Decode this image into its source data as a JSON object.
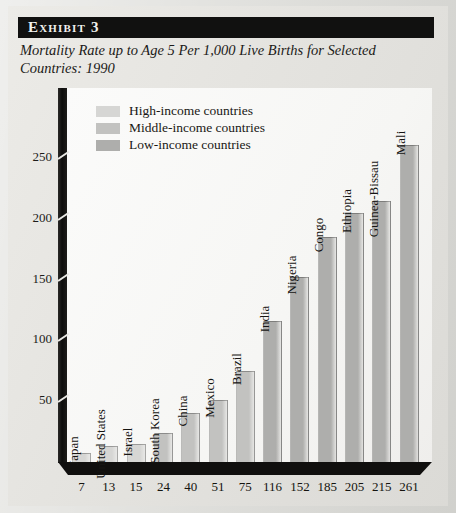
{
  "exhibit": {
    "label": "Exhibit 3",
    "title": "Mortality Rate up to Age 5 Per 1,000 Live Births for Selected Countries: 1990"
  },
  "legend": {
    "items": [
      {
        "label": "High-income countries",
        "color": "#d6d6d4"
      },
      {
        "label": "Middle-income countries",
        "color": "#c2c2c0"
      },
      {
        "label": "Low-income countries",
        "color": "#aeaeac"
      }
    ]
  },
  "chart_data": {
    "type": "bar",
    "title": "Mortality Rate up to Age 5 Per 1,000 Live Births for Selected Countries: 1990",
    "xlabel": "",
    "ylabel": "",
    "ylim": [
      0,
      280
    ],
    "yticks": [
      50,
      100,
      150,
      200,
      250
    ],
    "grid": false,
    "legend_position": "top-left",
    "categories": [
      "Japan",
      "United States",
      "Israel",
      "South Korea",
      "China",
      "Mexico",
      "Brazil",
      "India",
      "Nigeria",
      "Congo",
      "Ethiopia",
      "Guinea-Bissau",
      "Mali"
    ],
    "values": [
      7,
      13,
      15,
      24,
      40,
      51,
      75,
      116,
      152,
      185,
      205,
      215,
      261
    ],
    "groups": [
      "High-income countries",
      "High-income countries",
      "High-income countries",
      "Middle-income countries",
      "Middle-income countries",
      "Middle-income countries",
      "Middle-income countries",
      "Low-income countries",
      "Low-income countries",
      "Low-income countries",
      "Low-income countries",
      "Low-income countries",
      "Low-income countries"
    ]
  }
}
